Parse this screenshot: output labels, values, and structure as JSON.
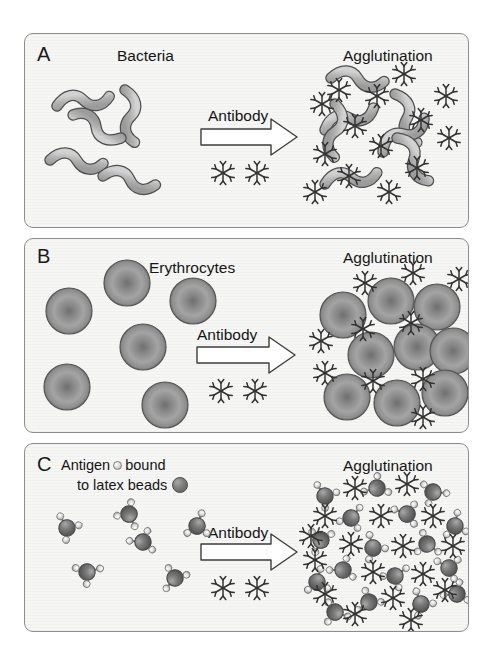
{
  "figure": {
    "background_color": "#ffffff",
    "panel_background": "#f6f6f4",
    "panel_border_color": "#8d8d8d",
    "ink_color": "#1a1a1a"
  },
  "panels": [
    {
      "letter": "A",
      "antigen_label": "Bacteria",
      "reaction_label": "Antibody",
      "result_label": "Agglutination",
      "particle_type": "bacteria",
      "particle_color": "#b9b9b9",
      "particle_outline": "#4f4f4f",
      "free_particle_count": 5,
      "clustered_particle_count": 7,
      "antibody_count_on_arrow": 2,
      "antibody_count_in_cluster": 14
    },
    {
      "letter": "B",
      "antigen_label": "Erythrocytes",
      "reaction_label": "Antibody",
      "result_label": "Agglutination",
      "particle_type": "erythrocyte",
      "particle_color": "#8f8f8f",
      "particle_outline": "#555555",
      "free_particle_count": 6,
      "clustered_particle_count": 9,
      "antibody_count_on_arrow": 2,
      "antibody_count_in_cluster": 10
    },
    {
      "letter": "C",
      "antigen_label_part1": "Antigen",
      "antigen_label_part2": "bound",
      "antigen_label_line2": "to latex beads",
      "reaction_label": "Antibody",
      "result_label": "Agglutination",
      "particle_type": "latex-bead",
      "particle_color": "#6e6e6e",
      "particle_outline": "#4a4a4a",
      "antigen_dot_color": "#e2e2e2",
      "free_particle_count": 6,
      "clustered_particle_count": 17,
      "antibody_count_on_arrow": 2,
      "antibody_count_in_cluster": 17,
      "antigen_dots_per_bead": 3
    }
  ],
  "icons": {
    "antibody": "antibody-star-icon",
    "arrow": "block-arrow-right-icon",
    "bacterium": "spirillum-icon",
    "erythrocyte": "red-blood-cell-icon",
    "latex_bead": "latex-bead-icon"
  }
}
